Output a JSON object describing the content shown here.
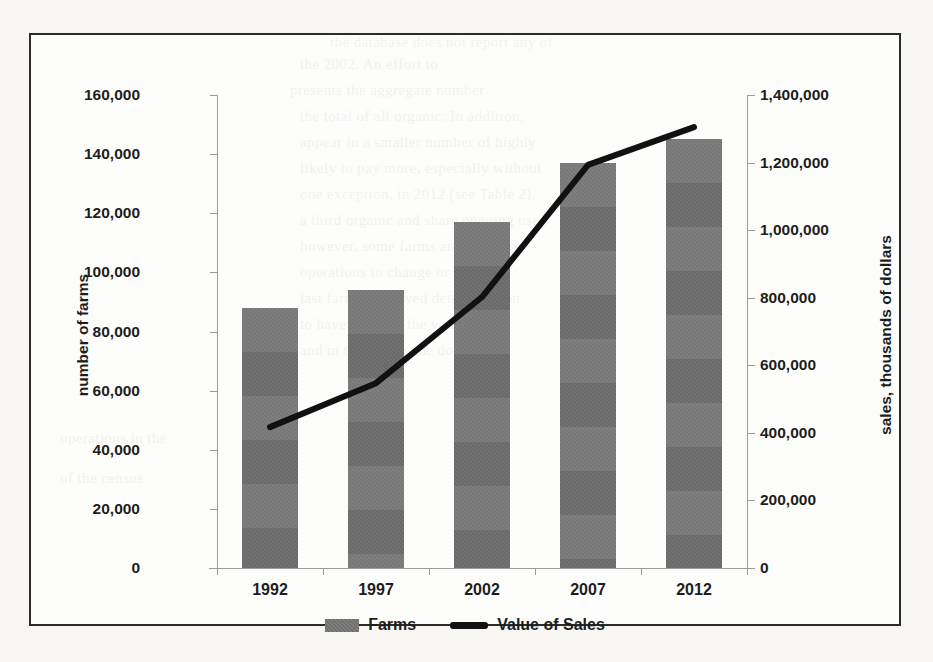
{
  "chart_data": {
    "type": "bar",
    "title": "",
    "categories": [
      "1992",
      "1997",
      "2002",
      "2007",
      "2012"
    ],
    "xlabel": "",
    "grid": false,
    "legend_position": "bottom",
    "axes": {
      "left": {
        "label": "number of farms",
        "ticks": [
          "0",
          "20,000",
          "40,000",
          "60,000",
          "80,000",
          "100,000",
          "120,000",
          "140,000",
          "160,000"
        ],
        "tick_values": [
          0,
          20000,
          40000,
          60000,
          80000,
          100000,
          120000,
          140000,
          160000
        ],
        "ylim": [
          0,
          160000
        ]
      },
      "right": {
        "label": "sales, thousands of dollars",
        "ticks": [
          "0",
          "200,000",
          "400,000",
          "600,000",
          "800,000",
          "1,000,000",
          "1,200,000",
          "1,400,000"
        ],
        "tick_values": [
          0,
          200000,
          400000,
          600000,
          800000,
          1000000,
          1200000,
          1400000
        ],
        "ylim": [
          0,
          1400000
        ]
      }
    },
    "series": [
      {
        "name": "Farms",
        "render": "bar",
        "axis": "left",
        "color": "#6f6f6f",
        "values": [
          88000,
          94000,
          117000,
          137000,
          145000
        ]
      },
      {
        "name": "Value of Sales",
        "render": "line",
        "axis": "right",
        "color": "#111111",
        "values": [
          417000,
          547000,
          802000,
          1193000,
          1305000
        ]
      }
    ]
  },
  "legend": {
    "items": [
      {
        "label": "Farms",
        "marker": "bar-swatch"
      },
      {
        "label": "Value of Sales",
        "marker": "line-swatch"
      }
    ]
  },
  "page_background_text": [
    "the database does not report any of",
    "2002. An effort to",
    "presents the aggregate number",
    "total of all organic. In addition,",
    "appear in a smaller number of highly",
    "to pay more, especially without these",
    "one exception, in 2012 (see Table 2). Of the",
    "and a third organic and share ongoing",
    "use; however, some farms are to",
    "operations to change or",
    "last farms improved determination",
    "to have in 2007, the value of",
    "and",
    "in the census the doubling",
    "",
    "",
    "",
    ""
  ]
}
